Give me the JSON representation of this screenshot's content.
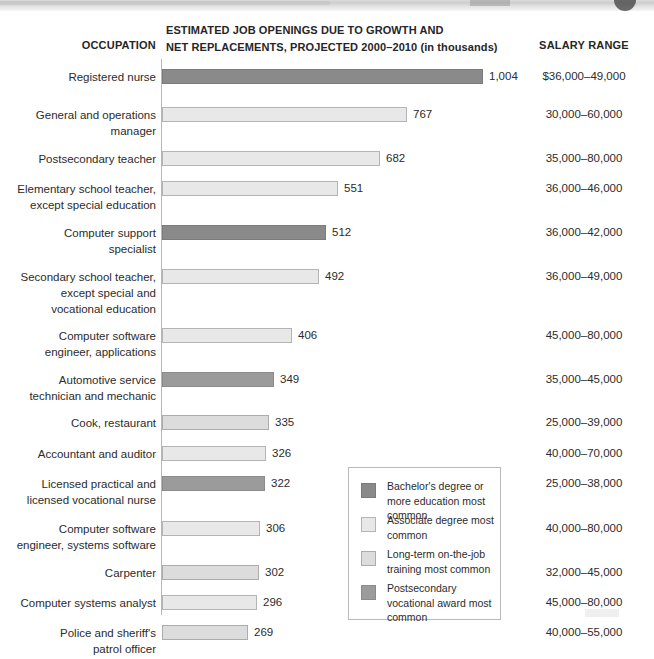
{
  "header": {
    "occupation_label": "OCCUPATION",
    "center_line1": "ESTIMATED JOB OPENINGS DUE TO GROWTH AND",
    "center_line2": "NET REPLACEMENTS, PROJECTED 2000–2010 (in thousands)",
    "salary_label": "SALARY RANGE"
  },
  "legend": {
    "items": [
      {
        "key": "bachelor",
        "label": "Bachelor's degree or more education most common",
        "color": "#8a8a8a"
      },
      {
        "key": "associate",
        "label": "Associate degree most common",
        "color": "#e8e8e8"
      },
      {
        "key": "longterm",
        "label": "Long-term on-the-job training most common",
        "color": "#dcdcdc"
      },
      {
        "key": "postsec",
        "label": "Postsecondary vocational award most common",
        "color": "#9b9b9b"
      }
    ]
  },
  "chart_data": {
    "type": "bar",
    "orientation": "horizontal",
    "title": "ESTIMATED JOB OPENINGS DUE TO GROWTH AND NET REPLACEMENTS, PROJECTED 2000–2010 (in thousands)",
    "xlabel": "",
    "ylabel": "OCCUPATION",
    "xlim": [
      0,
      1004
    ],
    "grid": false,
    "legend_position": "inside-right",
    "units": "thousands",
    "categories": [
      "Registered nurse",
      "General and operations manager",
      "Postsecondary teacher",
      "Elementary school teacher, except special education",
      "Computer support specialist",
      "Secondary school teacher, except special and vocational education",
      "Computer software engineer, applications",
      "Automotive service technician and mechanic",
      "Cook, restaurant",
      "Accountant and auditor",
      "Licensed practical and licensed vocational nurse",
      "Computer software engineer, systems software",
      "Carpenter",
      "Computer systems analyst",
      "Police and sheriff's patrol officer"
    ],
    "values": [
      1004,
      767,
      682,
      551,
      512,
      492,
      406,
      349,
      335,
      326,
      322,
      306,
      302,
      296,
      269
    ],
    "value_labels": [
      "1,004",
      "767",
      "682",
      "551",
      "512",
      "492",
      "406",
      "349",
      "335",
      "326",
      "322",
      "306",
      "302",
      "296",
      "269"
    ],
    "education_categories": [
      "bachelor",
      "associate",
      "associate",
      "associate",
      "bachelor",
      "associate",
      "associate",
      "postsec",
      "longterm",
      "associate",
      "postsec",
      "associate",
      "longterm",
      "associate",
      "longterm"
    ],
    "salary_ranges": [
      "$36,000–49,000",
      "30,000–60,000",
      "35,000–80,000",
      "36,000–46,000",
      "36,000–42,000",
      "36,000–49,000",
      "45,000–80,000",
      "35,000–45,000",
      "25,000–39,000",
      "40,000–70,000",
      "25,000–38,000",
      "40,000–80,000",
      "32,000–45,000",
      "45,000–80,000",
      "40,000–55,000"
    ]
  },
  "rows": [
    {
      "label_lines": [
        "Registered nurse"
      ],
      "value_label": "1,004",
      "value": 1004,
      "type": "bachelor",
      "salary": "$36,000–49,000",
      "top": 12,
      "label_top": 12,
      "height": 34
    },
    {
      "label_lines": [
        "General and operations",
        "manager"
      ],
      "value_label": "767",
      "value": 767,
      "type": "associate",
      "salary": "30,000–60,000",
      "top": 50,
      "label_top": 50,
      "height": 48
    },
    {
      "label_lines": [
        "Postsecondary teacher"
      ],
      "value_label": "682",
      "value": 682,
      "type": "associate",
      "salary": "35,000–80,000",
      "top": 94,
      "label_top": 94,
      "height": 34
    },
    {
      "label_lines": [
        "Elementary school teacher,",
        "except special education"
      ],
      "value_label": "551",
      "value": 551,
      "type": "associate",
      "salary": "36,000–46,000",
      "top": 124,
      "label_top": 124,
      "height": 48
    },
    {
      "label_lines": [
        "Computer support",
        "specialist"
      ],
      "value_label": "512",
      "value": 512,
      "type": "bachelor",
      "salary": "36,000–42,000",
      "top": 168,
      "label_top": 168,
      "height": 48
    },
    {
      "label_lines": [
        "Secondary school teacher,",
        "except special and",
        "vocational education"
      ],
      "value_label": "492",
      "value": 492,
      "type": "associate",
      "salary": "36,000–49,000",
      "top": 212,
      "label_top": 212,
      "height": 62
    },
    {
      "label_lines": [
        "Computer software",
        "engineer, applications"
      ],
      "value_label": "406",
      "value": 406,
      "type": "associate",
      "salary": "45,000–80,000",
      "top": 271,
      "label_top": 271,
      "height": 48
    },
    {
      "label_lines": [
        "Automotive service",
        "technician and mechanic"
      ],
      "value_label": "349",
      "value": 349,
      "type": "postsec",
      "salary": "35,000–45,000",
      "top": 315,
      "label_top": 315,
      "height": 48
    },
    {
      "label_lines": [
        "Cook, restaurant"
      ],
      "value_label": "335",
      "value": 335,
      "type": "longterm",
      "salary": "25,000–39,000",
      "top": 358,
      "label_top": 358,
      "height": 34
    },
    {
      "label_lines": [
        "Accountant and auditor"
      ],
      "value_label": "326",
      "value": 326,
      "type": "associate",
      "salary": "40,000–70,000",
      "top": 389,
      "label_top": 389,
      "height": 34
    },
    {
      "label_lines": [
        "Licensed practical and",
        "licensed vocational nurse"
      ],
      "value_label": "322",
      "value": 322,
      "type": "postsec",
      "salary": "25,000–38,000",
      "top": 419,
      "label_top": 419,
      "height": 48
    },
    {
      "label_lines": [
        "Computer software",
        "engineer, systems software"
      ],
      "value_label": "306",
      "value": 306,
      "type": "associate",
      "salary": "40,000–80,000",
      "top": 464,
      "label_top": 464,
      "height": 48
    },
    {
      "label_lines": [
        "Carpenter"
      ],
      "value_label": "302",
      "value": 302,
      "type": "longterm",
      "salary": "32,000–45,000",
      "top": 508,
      "label_top": 508,
      "height": 34
    },
    {
      "label_lines": [
        "Computer systems analyst"
      ],
      "value_label": "296",
      "value": 296,
      "type": "associate",
      "salary": "45,000–80,000",
      "top": 538,
      "label_top": 538,
      "height": 34
    },
    {
      "label_lines": [
        "Police and sheriff's",
        "patrol officer"
      ],
      "value_label": "269",
      "value": 269,
      "type": "longterm",
      "salary": "40,000–55,000",
      "top": 568,
      "label_top": 568,
      "height": 48
    }
  ]
}
